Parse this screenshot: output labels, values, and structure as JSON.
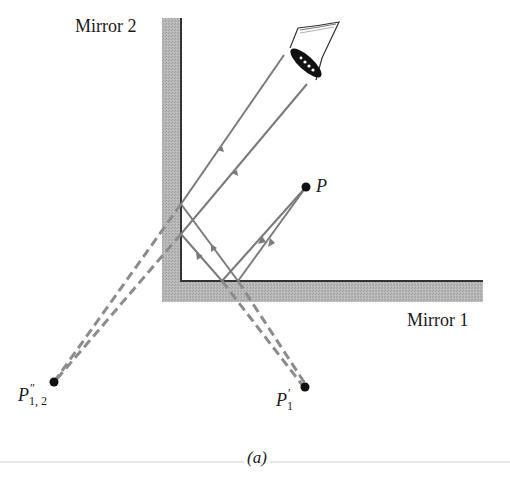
{
  "figure": {
    "caption": "(a)",
    "mirrors": [
      {
        "id": "mirror-1",
        "label": "Mirror 1",
        "orientation": "horizontal"
      },
      {
        "id": "mirror-2",
        "label": "Mirror 2",
        "orientation": "vertical"
      }
    ],
    "points": {
      "object": {
        "label": "P",
        "x": 306,
        "y": 187
      },
      "image_1": {
        "label_base": "P",
        "label_sup": "′",
        "label_sub": "1",
        "x": 305,
        "y": 387
      },
      "image_12": {
        "label_base": "P",
        "label_sup": "″",
        "label_sub": "1, 2",
        "x": 54,
        "y": 382
      }
    },
    "observer": {
      "icon": "eye-icon"
    },
    "colors": {
      "mirror_fill": "#b3b3b3",
      "mirror_edge": "#333333",
      "ray": "#7a7a7a",
      "dashed_ray": "#8c8c8c",
      "point": "#111111",
      "text": "#1a1a1a",
      "caption_rule": "#e6e6e6"
    }
  }
}
